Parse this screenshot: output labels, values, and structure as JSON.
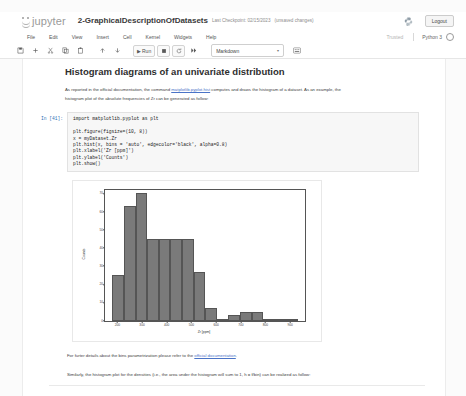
{
  "header": {
    "logo_text": "jupyter",
    "notebook_title": "2-GraphicalDescriptionOfDatasets",
    "checkpoint": "Last Checkpoint: 02/15/2023",
    "unsaved": "(unsaved changes)",
    "logout_label": "Logout"
  },
  "menubar": {
    "items": [
      {
        "label": "File"
      },
      {
        "label": "Edit"
      },
      {
        "label": "View"
      },
      {
        "label": "Insert"
      },
      {
        "label": "Cell"
      },
      {
        "label": "Kernel"
      },
      {
        "label": "Widgets"
      },
      {
        "label": "Help"
      }
    ],
    "trusted_label": "Trusted",
    "kernel_name": "Python 3"
  },
  "toolbar": {
    "save_icon": "save-icon",
    "insert_icon": "plus-icon",
    "cut_icon": "scissors-icon",
    "copy_icon": "copy-icon",
    "paste_icon": "paste-icon",
    "move_up_icon": "arrow-up-icon",
    "move_down_icon": "arrow-down-icon",
    "run_label": "Run",
    "stop_icon": "stop-square-icon",
    "restart_icon": "restart-icon",
    "restart_run_all_icon": "fast-forward-icon",
    "cell_type_value": "Markdown",
    "command_palette_icon": "keyboard-icon"
  },
  "notebook": {
    "heading": "Histogram diagrams of an univariate distribution",
    "intro_line_1_a": "As reported in the official documentation, the command ",
    "intro_link_1": "matplotlib.pyplot.hist",
    "intro_line_1_b": " computes and draws the histogram of a dataset. As an example, the",
    "intro_line_2": "histogram plot of the absolute frequencies of Zr can be generated as follow:",
    "code_prompt": "In [41]:",
    "code_import": "import matplotlib.pyplot as plt",
    "code_body": "plt.figure(figsize=(10, 8))\nx = myDataset.Zr\nplt.hist(x, bins = 'auto', edgecolor='black', alpha=0.8)\nplt.xlabel('Zr [ppm]')\nplt.ylabel('Counts')\nplt.show()",
    "after_fig_line_a": "For furter details about the bins parametrization please refer to the ",
    "after_fig_link": "official documentation",
    "after_fig_line_b": ".",
    "last_line": "Similarly, the histogram plot for the densities (i.e., the area under the histogram will sum to 1, h = f/bin) can be realized as follow:"
  },
  "chart_data": {
    "type": "bar",
    "title": "",
    "xlabel": "Zr [ppm]",
    "ylabel": "Counts",
    "xlim": [
      150,
      960
    ],
    "ylim": [
      0,
      72
    ],
    "xticks": [
      200,
      300,
      400,
      500,
      600,
      700,
      800,
      900
    ],
    "yticks": [
      0,
      10,
      20,
      30,
      40,
      50,
      60,
      70
    ],
    "grid": false,
    "legend": "none",
    "bin_edges": [
      180,
      227,
      274,
      321,
      368,
      415,
      462,
      509,
      556,
      603,
      650,
      697,
      744,
      791,
      838,
      885,
      932
    ],
    "values": [
      25,
      63,
      70,
      45,
      45,
      45,
      45,
      27,
      7,
      1,
      3,
      5,
      5,
      0,
      1,
      1
    ],
    "bar_color": "#5a5a5a",
    "edge_color": "#000000",
    "alpha": 0.8
  }
}
